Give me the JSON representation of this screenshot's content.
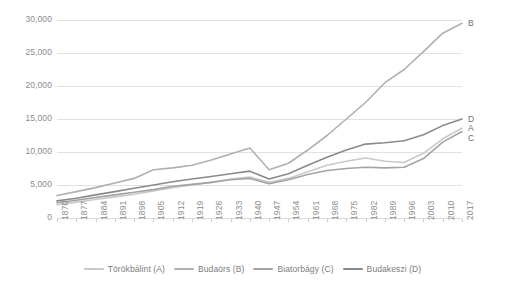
{
  "chart_data": {
    "type": "line",
    "title": "",
    "subtitle": "",
    "xlabel": "",
    "ylabel": "",
    "grid": true,
    "legend_position": "bottom",
    "xlim": [
      1870,
      2017
    ],
    "ylim": [
      0,
      30000
    ],
    "y_ticks": [
      0,
      5000,
      10000,
      15000,
      20000,
      25000,
      30000
    ],
    "y_tick_labels": [
      "0",
      "5,000",
      "10,000",
      "15,000",
      "20,000",
      "25,000",
      "30,000"
    ],
    "x": [
      1870,
      1877,
      1884,
      1891,
      1898,
      1905,
      1912,
      1919,
      1926,
      1933,
      1940,
      1947,
      1954,
      1961,
      1968,
      1975,
      1982,
      1989,
      1996,
      2003,
      2010,
      2017
    ],
    "categories": [
      "1870",
      "1877",
      "1884",
      "1891",
      "1898",
      "1905",
      "1912",
      "1919",
      "1926",
      "1933",
      "1940",
      "1947",
      "1954",
      "1961",
      "1968",
      "1975",
      "1982",
      "1989",
      "1996",
      "2003",
      "2010",
      "2017"
    ],
    "series": [
      {
        "name": "Törökbálint (A)",
        "key": "A",
        "color": "#c9c9c9",
        "end_label": "A",
        "values": [
          2000,
          2400,
          2800,
          3200,
          3600,
          4100,
          4600,
          5000,
          5400,
          5900,
          6200,
          5400,
          6000,
          7000,
          8000,
          8600,
          9100,
          8600,
          8400,
          9800,
          12000,
          13600
        ]
      },
      {
        "name": "Budaörs (B)",
        "key": "B",
        "color": "#b0b0b0",
        "end_label": "B",
        "values": [
          3400,
          4000,
          4600,
          5300,
          6000,
          7300,
          7600,
          8000,
          8800,
          9700,
          10600,
          7300,
          8300,
          10300,
          12500,
          15000,
          17500,
          20500,
          22500,
          25200,
          28000,
          29500
        ]
      },
      {
        "name": "Biatorbágy (C)",
        "key": "C",
        "color": "#a3a3a3",
        "end_label": "C",
        "values": [
          2300,
          2700,
          3100,
          3500,
          3900,
          4300,
          4800,
          5100,
          5400,
          5800,
          6000,
          5200,
          5800,
          6600,
          7200,
          7500,
          7700,
          7600,
          7700,
          9000,
          11500,
          13100
        ]
      },
      {
        "name": "Budakeszi (D)",
        "key": "D",
        "color": "#8a8a8a",
        "end_label": "D",
        "values": [
          2600,
          3000,
          3500,
          4000,
          4500,
          5000,
          5500,
          5900,
          6300,
          6700,
          7100,
          5900,
          6700,
          8000,
          9200,
          10300,
          11200,
          11400,
          11700,
          12600,
          14000,
          15000
        ]
      }
    ]
  },
  "legend": {
    "items": [
      {
        "label": "Törökbálint (A)",
        "color": "#c9c9c9"
      },
      {
        "label": "Budaörs (B)",
        "color": "#b0b0b0"
      },
      {
        "label": "Biatorbágy (C)",
        "color": "#a3a3a3"
      },
      {
        "label": "Budakeszi (D)",
        "color": "#8a8a8a"
      }
    ]
  },
  "axis_colors": {
    "gridline": "#e2e2e2",
    "tick_text": "#8c8c8c",
    "legend_text": "#7d7d7d",
    "end_label_text": "#6e6e6e"
  }
}
